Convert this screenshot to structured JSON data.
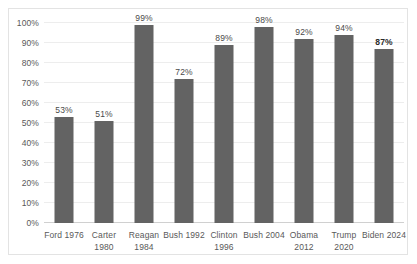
{
  "chart_data": {
    "type": "bar",
    "title": "",
    "subtitle": "",
    "xlabel": "",
    "ylabel": "",
    "categories": [
      "Ford 1976",
      "Carter 1980",
      "Reagan 1984",
      "Bush 1992",
      "Clinton 1996",
      "Bush 2004",
      "Obama 2012",
      "Trump 2020",
      "Biden 2024"
    ],
    "values": [
      53,
      51,
      99,
      72,
      89,
      98,
      92,
      94,
      87
    ],
    "data_labels": [
      "53%",
      "51%",
      "99%",
      "72%",
      "89%",
      "98%",
      "92%",
      "94%",
      "87%"
    ],
    "emphasized_index": 8,
    "ylim": [
      0,
      100
    ],
    "ytick_values": [
      0,
      10,
      20,
      30,
      40,
      50,
      60,
      70,
      80,
      90,
      100
    ],
    "ytick_labels": [
      "0%",
      "10%",
      "20%",
      "30%",
      "40%",
      "50%",
      "60%",
      "70%",
      "80%",
      "90%",
      "100%"
    ],
    "grid": true,
    "legend": false,
    "legend_position": "none",
    "bar_color": "#636363",
    "gridline_color": "#ededed",
    "axis_color": "#d0d0d0",
    "plot_background": "#ffffff",
    "frame_color": "#e3e3e3"
  }
}
